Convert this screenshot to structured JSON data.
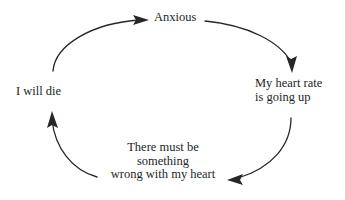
{
  "diagram": {
    "type": "cycle",
    "title": "",
    "background_color": "#ffffff",
    "stroke_color": "#2a2626",
    "text_color": "#221f1f",
    "nodes": [
      {
        "id": "anxious",
        "lines": [
          "Anxious"
        ],
        "position": "top"
      },
      {
        "id": "heart-rate",
        "lines": [
          "My heart rate",
          "is going up"
        ],
        "position": "right"
      },
      {
        "id": "wrong-heart",
        "lines": [
          "There must be",
          "something",
          "wrong with my heart"
        ],
        "position": "bottom"
      },
      {
        "id": "i-will-die",
        "lines": [
          "I will die"
        ],
        "position": "left"
      }
    ],
    "arrows": [
      {
        "id": "anxious-to-heart-rate",
        "from": "anxious",
        "to": "heart-rate",
        "direction": "down-right"
      },
      {
        "id": "heart-rate-to-wrong-heart",
        "from": "heart-rate",
        "to": "wrong-heart",
        "direction": "down-left"
      },
      {
        "id": "wrong-heart-to-i-will-die",
        "from": "wrong-heart",
        "to": "i-will-die",
        "direction": "up-left"
      },
      {
        "id": "i-will-die-to-anxious",
        "from": "i-will-die",
        "to": "anxious",
        "direction": "up-right"
      }
    ]
  }
}
